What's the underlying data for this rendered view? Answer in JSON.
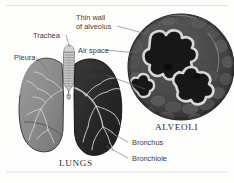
{
  "figure": {
    "background_color": "#fdfdfc",
    "text_color": "#3b3b3b",
    "leader_line_color": "#6e6e6e",
    "rule_color": "#e2e2e2"
  },
  "labels": {
    "thin_wall_line1": "Thin wall",
    "thin_wall_line2": "of alveolus",
    "air_space": "Air space",
    "blood_vessel_line1": "Blood",
    "blood_vessel_line2": "vessel",
    "trachea": "Trachea",
    "pleura": "Pleura",
    "bronchus": "Bronchus",
    "bronchiole": "Bronchiole"
  },
  "captions": {
    "alveoli": "ALVEOLI",
    "lungs": "LUNGS"
  },
  "structures": {
    "left_lung": {
      "name": "left-lung",
      "fill": "#8d8d8d",
      "outline": "#3a3a3a"
    },
    "right_lung": {
      "name": "right-lung",
      "fill": "#2b2b2b",
      "outline": "#1a1a1a"
    },
    "trachea": {
      "name": "trachea",
      "fill": "#c9c9c9",
      "outline": "#6a6a6a",
      "cartilage_rings": 13
    },
    "alveoli_circle": {
      "name": "alveoli-micrograph",
      "center_x": 181,
      "center_y": 67,
      "radius": 53,
      "tissue_fill": "#4a4a4a",
      "air_space_fill": "#171717",
      "wall_color": "#d8d8d8",
      "blood_vessel_count": 2
    }
  }
}
